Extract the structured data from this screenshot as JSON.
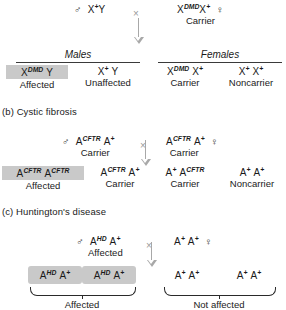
{
  "theme": {
    "shade_color": "#c9c9c9",
    "arrow_color": "#a8a8a8",
    "rule_color": "#3a3a3a",
    "text_color": "#1a1a1a"
  },
  "symbols": {
    "male": "♂",
    "female": "♀",
    "cross": "×"
  },
  "sections": {
    "a": {
      "father": {
        "genotype_base": "X",
        "genotype_sup": "+",
        "genotype_tail": "Y",
        "phenotype": ""
      },
      "mother": {
        "genotype_base": "X",
        "genotype_sup": "DMD",
        "genotype_tail": "X",
        "genotype_tail_sup": "+",
        "phenotype": "Carrier"
      },
      "group_males": "Males",
      "group_females": "Females",
      "offspring": [
        {
          "base": "X",
          "sup": "DMD",
          "tail": "Y",
          "tail_sup": "",
          "phenotype": "Affected",
          "shaded": true
        },
        {
          "base": "X",
          "sup": "+",
          "tail": "Y",
          "tail_sup": "",
          "phenotype": "Unaffected",
          "shaded": false
        },
        {
          "base": "X",
          "sup": "DMD",
          "tail": "X",
          "tail_sup": "+",
          "phenotype": "Carrier",
          "shaded": false
        },
        {
          "base": "X",
          "sup": "+",
          "tail": "X",
          "tail_sup": "+",
          "phenotype": "Noncarrier",
          "shaded": false
        }
      ]
    },
    "b": {
      "title": "(b) Cystic fibrosis",
      "father": {
        "base": "A",
        "sup": "CFTR",
        "tail": "A",
        "tail_sup": "+",
        "phenotype": "Carrier"
      },
      "mother": {
        "base": "A",
        "sup": "CFTR",
        "tail": "A",
        "tail_sup": "+",
        "phenotype": "Carrier"
      },
      "offspring": [
        {
          "base": "A",
          "sup": "CFTR",
          "tail": "A",
          "tail_sup": "CFTR",
          "phenotype": "Affected",
          "shaded": true
        },
        {
          "base": "A",
          "sup": "CFTR",
          "tail": "A",
          "tail_sup": "+",
          "phenotype": "Carrier",
          "shaded": false
        },
        {
          "base": "A",
          "sup": "+",
          "tail": "A",
          "tail_sup": "CFTR",
          "phenotype": "Carrier",
          "shaded": false
        },
        {
          "base": "A",
          "sup": "+",
          "tail": "A",
          "tail_sup": "+",
          "phenotype": "Noncarrier",
          "shaded": false
        }
      ]
    },
    "c": {
      "title": "(c) Huntington's disease",
      "father": {
        "base": "A",
        "sup": "HD",
        "tail": "A",
        "tail_sup": "+",
        "phenotype": "Affected"
      },
      "mother": {
        "base": "A",
        "sup": "+",
        "tail": "A",
        "tail_sup": "+",
        "phenotype": ""
      },
      "offspring": [
        {
          "base": "A",
          "sup": "HD",
          "tail": "A",
          "tail_sup": "+",
          "shaded": true
        },
        {
          "base": "A",
          "sup": "HD",
          "tail": "A",
          "tail_sup": "+",
          "shaded": true
        },
        {
          "base": "A",
          "sup": "+",
          "tail": "A",
          "tail_sup": "+",
          "shaded": false
        },
        {
          "base": "A",
          "sup": "+",
          "tail": "A",
          "tail_sup": "+",
          "shaded": false
        }
      ],
      "brace_left_label": "Affected",
      "brace_right_label": "Not affected"
    }
  }
}
